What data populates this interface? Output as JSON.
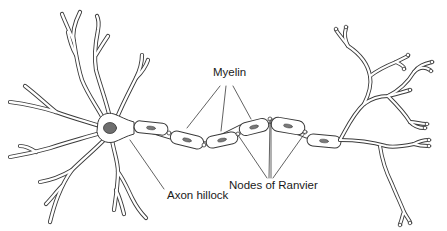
{
  "diagram": {
    "labels": {
      "myelin": "Myelin",
      "nodes_of_ranvier": "Nodes of Ranvier",
      "axon_hillock": "Axon hillock"
    },
    "colors": {
      "outline": "#3a3a3a",
      "fill": "#ffffff",
      "nucleus": "#6e6e6e",
      "schwann_nucleus": "#7a7a7a",
      "leader": "#3a3a3a",
      "text": "#1a1a1a"
    }
  }
}
